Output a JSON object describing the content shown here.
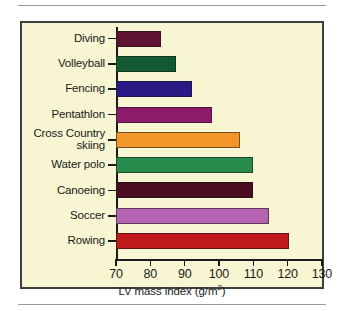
{
  "figure": {
    "panel_background": "#f7f5d2",
    "border_color": "#3f3f3f",
    "rule_color": "#9a9a9a"
  },
  "chart_data": {
    "type": "bar",
    "orientation": "horizontal",
    "title": "",
    "xlabel": "LV mass index (g/m2)",
    "xlabel_base": "LV mass index (g/m",
    "xlabel_sup": "2",
    "xlabel_tail": ")",
    "ylabel": "",
    "xlim": [
      70,
      130
    ],
    "xticks": [
      70,
      80,
      90,
      100,
      110,
      120,
      130
    ],
    "xticklabels": [
      "70",
      "80",
      "90",
      "100",
      "110",
      "120",
      "130"
    ],
    "grid": false,
    "legend": "none",
    "categories": [
      "Diving",
      "Volleyball",
      "Fencing",
      "Pentathlon",
      "Cross Country\nskiing",
      "Water polo",
      "Canoeing",
      "Soccer",
      "Rowing"
    ],
    "values": [
      83,
      87.5,
      92,
      98,
      106,
      110,
      110,
      114.5,
      120.5
    ],
    "colors": [
      "#5f1330",
      "#135a32",
      "#2a1a86",
      "#8d1b6b",
      "#f2962a",
      "#2a8b4f",
      "#4a0d20",
      "#b463b0",
      "#c11a1c"
    ],
    "bars": [
      {
        "category": "Diving",
        "value": 83,
        "color": "#5f1330"
      },
      {
        "category": "Volleyball",
        "value": 87.5,
        "color": "#135a32"
      },
      {
        "category": "Fencing",
        "value": 92,
        "color": "#2a1a86"
      },
      {
        "category": "Pentathlon",
        "value": 98,
        "color": "#8d1b6b"
      },
      {
        "category": "Cross Country skiing",
        "value": 106,
        "color": "#f2962a"
      },
      {
        "category": "Water polo",
        "value": 110,
        "color": "#2a8b4f"
      },
      {
        "category": "Canoeing",
        "value": 110,
        "color": "#4a0d20"
      },
      {
        "category": "Soccer",
        "value": 114.5,
        "color": "#b463b0"
      },
      {
        "category": "Rowing",
        "value": 120.5,
        "color": "#c11a1c"
      }
    ]
  }
}
